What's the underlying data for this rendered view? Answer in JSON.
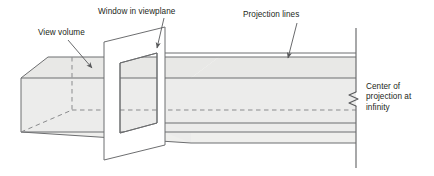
{
  "figure": {
    "name": "parallel-projection-view-volume-diagram",
    "type": "technical-line-diagram",
    "background_color": "#ffffff"
  },
  "labels": {
    "view_volume": "View volume",
    "window_in_viewplane": "Window in viewplane",
    "projection_lines": "Projection lines",
    "center_of_projection": "Center of\nprojection at\ninfinity"
  },
  "colors": {
    "stroke": "#6d6e70",
    "stroke_dark": "#58595b",
    "text": "#231f20",
    "face_fill": "#e8e8e6",
    "face_fill_light": "#efefed",
    "viewplane_fill": "#ffffff",
    "page_background": "#ffffff"
  },
  "geometry": {
    "view_volume": {
      "description": "truncated rectangular prism drawn in oblique projection, opening toward the right",
      "left_face_corners": [
        [
          21,
          78
        ],
        [
          21,
          132
        ],
        [
          72,
          132
        ],
        [
          72,
          78
        ]
      ],
      "top_face_corners": [
        [
          21,
          78
        ],
        [
          48,
          57
        ],
        [
          219,
          57
        ],
        [
          191,
          78
        ]
      ],
      "apex_vanishing_x": 356
    },
    "viewplane": {
      "description": "white parallelogram representing the viewplane with a rectangular window cut in it",
      "outer_corners": [
        [
          104,
          42
        ],
        [
          165,
          27
        ],
        [
          165,
          145
        ],
        [
          104,
          160
        ]
      ],
      "window_corners": [
        [
          120,
          63
        ],
        [
          157,
          53
        ],
        [
          157,
          123
        ],
        [
          120,
          133
        ]
      ]
    },
    "projection_lines": {
      "description": "horizontal extrusion edges running right to the center of projection at infinity",
      "terminal_vertical_line_x": 356,
      "terminal_vertical_line_y_range": [
        28,
        168
      ]
    },
    "break_symbol": {
      "description": "zigzag break glyph on the terminal vertical line indicating infinite distance",
      "x": 356,
      "y": 98
    },
    "hidden_lines": {
      "description": "dashed edges of the hidden back faces of the view volume",
      "vertical": [
        [
          72,
          57
        ],
        [
          72,
          110
        ]
      ],
      "horizontal": [
        [
          72,
          110
        ],
        [
          356,
          110
        ]
      ],
      "diagonal": [
        [
          21,
          132
        ],
        [
          72,
          110
        ]
      ]
    },
    "leaders": [
      {
        "name": "view-volume-leader",
        "from": [
          68,
          40
        ],
        "to": [
          92,
          68
        ]
      },
      {
        "name": "window-leader",
        "from": [
          163,
          19
        ],
        "to": [
          157,
          48
        ]
      },
      {
        "name": "projection-leader",
        "from": [
          296,
          24
        ],
        "to": [
          288,
          60
        ]
      }
    ]
  }
}
